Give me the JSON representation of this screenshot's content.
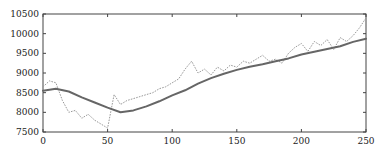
{
  "chart_data": {
    "type": "line",
    "title": "",
    "xlabel": "",
    "ylabel": "",
    "xlim": [
      0,
      250
    ],
    "ylim": [
      7500,
      10500
    ],
    "grid": false,
    "legend": null,
    "x_ticks": [
      0,
      50,
      100,
      150,
      200,
      250
    ],
    "y_ticks": [
      7500,
      8000,
      8500,
      9000,
      9500,
      10000,
      10500
    ],
    "series": [
      {
        "name": "smoothed",
        "style": "solid",
        "color": "#666666",
        "x": [
          0,
          10,
          20,
          30,
          40,
          50,
          60,
          70,
          80,
          90,
          100,
          110,
          120,
          130,
          140,
          150,
          160,
          170,
          180,
          190,
          200,
          210,
          220,
          230,
          240,
          250
        ],
        "values": [
          8550,
          8600,
          8530,
          8380,
          8250,
          8120,
          8000,
          8050,
          8150,
          8280,
          8430,
          8560,
          8730,
          8870,
          8980,
          9080,
          9160,
          9220,
          9300,
          9370,
          9470,
          9540,
          9610,
          9680,
          9790,
          9870
        ]
      },
      {
        "name": "observed",
        "style": "dotted",
        "color": "#999999",
        "x": [
          0,
          5,
          10,
          15,
          20,
          25,
          30,
          35,
          40,
          45,
          50,
          55,
          60,
          65,
          70,
          75,
          80,
          85,
          90,
          95,
          100,
          105,
          110,
          115,
          120,
          125,
          130,
          135,
          140,
          145,
          150,
          155,
          160,
          165,
          170,
          175,
          180,
          185,
          190,
          195,
          200,
          205,
          210,
          215,
          220,
          225,
          230,
          235,
          240,
          245,
          250
        ],
        "values": [
          8650,
          8800,
          8750,
          8300,
          8000,
          8050,
          7850,
          7950,
          7800,
          7700,
          7600,
          8450,
          8200,
          8300,
          8350,
          8400,
          8450,
          8500,
          8600,
          8650,
          8750,
          8850,
          9100,
          9300,
          9000,
          9100,
          8950,
          9150,
          9050,
          9200,
          9150,
          9300,
          9250,
          9350,
          9450,
          9300,
          9350,
          9250,
          9500,
          9650,
          9750,
          9550,
          9800,
          9700,
          9850,
          9600,
          9900,
          9800,
          9950,
          10150,
          10400
        ]
      }
    ]
  },
  "axes": {
    "x_tick_labels": [
      "0",
      "50",
      "100",
      "150",
      "200",
      "250"
    ],
    "y_tick_labels": [
      "7500",
      "8000",
      "8500",
      "9000",
      "9500",
      "10000",
      "10500"
    ]
  },
  "layout": {
    "plot_left": 43,
    "plot_right": 366,
    "plot_top": 14,
    "plot_bottom": 132,
    "axis_color": "#444444"
  }
}
